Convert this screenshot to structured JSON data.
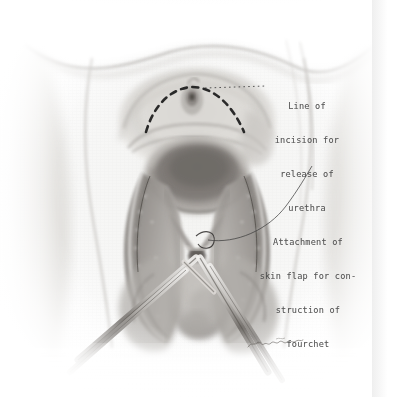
{
  "plate": {
    "medium": "pencil-illustration",
    "background_color": "#ffffff",
    "paper_tone": "#f4f4f2",
    "ink_color": "#4a4a4a",
    "width": 396,
    "height": 397
  },
  "annotations": [
    {
      "id": "line-of-incision",
      "lines": [
        "Line of",
        "incision for",
        "release of",
        "urethra"
      ],
      "leader": "dotted-horizontal",
      "leader_color": "#3a3a3a"
    },
    {
      "id": "attachment-of-skin-flap",
      "lines": [
        "Attachment of",
        "skin flap for con-",
        "struction of",
        "fourchet"
      ],
      "leader": "curved-thin",
      "leader_color": "#3a3a3a"
    }
  ],
  "markings": {
    "incision_line": {
      "style": "dashed",
      "color": "#1e1e1e",
      "shape": "inverted-arc"
    }
  },
  "signature": {
    "present": true,
    "legible": false,
    "style": "cursive"
  }
}
